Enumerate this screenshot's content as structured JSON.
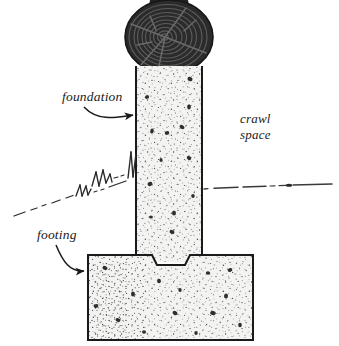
{
  "figure": {
    "type": "architectural-cross-section",
    "background_color": "#ffffff",
    "ink_color": "#1a1a1a"
  },
  "labels": {
    "foundation": "foundation",
    "footing": "footing",
    "crawl_space_line1": "crawl",
    "crawl_space_line2": "space"
  },
  "elements": {
    "post": {
      "name": "wood-post-end-grain",
      "description": "dark circular log cross-section with concentric growth rings and radial cracks",
      "fill_color": "#2b2b2b",
      "ring_color": "#555555",
      "center_x": 169,
      "center_y": 37,
      "radius_x": 44,
      "radius_y": 37,
      "ring_count": 9
    },
    "foundation_wall": {
      "name": "foundation-wall",
      "description": "vertical concrete pier wall, stippled concrete hatch",
      "fill_color": "#f2f2f0",
      "stroke_color": "#1a1a1a",
      "left": 136,
      "right": 202,
      "top": 66,
      "bottom": 262
    },
    "footing": {
      "name": "concrete-footing",
      "description": "wide rectangular concrete footing below the wall, with keyway notch at top",
      "fill_color": "#f2f2f0",
      "stroke_color": "#1a1a1a",
      "left": 88,
      "right": 253,
      "top": 255,
      "bottom": 340
    },
    "keyway": {
      "name": "keyway-notch",
      "description": "trapezoidal notch in the top of the footing beneath the wall",
      "left": 152,
      "right": 190,
      "depth": 10
    },
    "grade_line_left": {
      "name": "grade-line-left",
      "description": "sloping broken ground line with grass tufts, left of the pier",
      "style": "dash-dot",
      "from_x": 14,
      "from_y": 216,
      "to_x": 136,
      "to_y": 158
    },
    "grade_line_right": {
      "name": "grade-line-right",
      "description": "near-horizontal broken ground line right of the pier",
      "style": "dash-dot",
      "from_x": 204,
      "from_y": 188,
      "to_x": 332,
      "to_y": 184
    },
    "concrete_texture": {
      "name": "concrete-stipple-texture",
      "fine_dot_color": "#4a4a4a",
      "aggregate_color": "#3a3a3a"
    }
  },
  "annotations": [
    {
      "name": "foundation-callout",
      "label": "foundation",
      "text_x": 62,
      "text_y": 101,
      "arrow_from_x": 84,
      "arrow_from_y": 106,
      "arrow_to_x": 135,
      "arrow_to_y": 115
    },
    {
      "name": "footing-callout",
      "label": "footing",
      "text_x": 37,
      "text_y": 239,
      "arrow_from_x": 56,
      "arrow_from_y": 244,
      "arrow_to_x": 87,
      "arrow_to_y": 271
    },
    {
      "name": "crawl-space-label",
      "label_line1": "crawl",
      "label_line2": "space",
      "text_x": 240,
      "text_y": 123
    }
  ]
}
